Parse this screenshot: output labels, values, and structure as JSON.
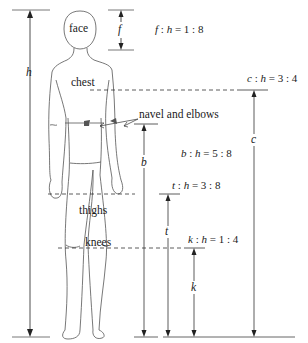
{
  "figure": {
    "body_labels": {
      "face": "face",
      "chest": "chest",
      "navel_elbows": "navel and elbows",
      "thighs": "thighs",
      "knees": "knees"
    },
    "dimension_symbols": {
      "h": "h",
      "f": "f",
      "c": "c",
      "b": "b",
      "t": "t",
      "k": "k"
    },
    "ratios": [
      {
        "var": "f",
        "sep1": " : ",
        "ref": "h",
        "eq": " = ",
        "value": "1 : 8"
      },
      {
        "var": "c",
        "sep1": " : ",
        "ref": "h",
        "eq": " = ",
        "value": "3 : 4"
      },
      {
        "var": "b",
        "sep1": " : ",
        "ref": "h",
        "eq": " = ",
        "value": "5 : 8"
      },
      {
        "var": "t",
        "sep1": " : ",
        "ref": "h",
        "eq": " = ",
        "value": "3 : 8"
      },
      {
        "var": "k",
        "sep1": " : ",
        "ref": "h",
        "eq": " = ",
        "value": "1 : 4"
      }
    ],
    "colors": {
      "line": "#333333",
      "figure_outline": "#555555",
      "marker_fill": "#555555",
      "background": "#ffffff"
    }
  }
}
